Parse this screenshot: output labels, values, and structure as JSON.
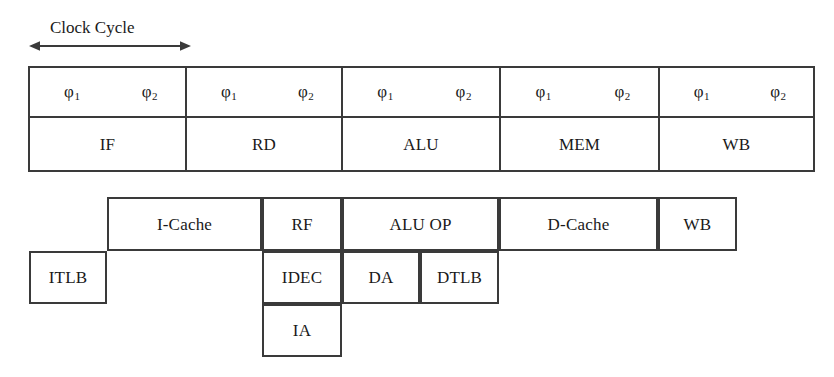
{
  "figure": {
    "line_color": "#3a3a3a",
    "background_color": "#ffffff"
  },
  "clock": {
    "label": "Clock Cycle",
    "arrow_icon": "double-headed-horizontal-arrow",
    "spans_stage": "IF"
  },
  "phase_table": {
    "phase_1_label": "φ",
    "phase_1_sub": "1",
    "phase_2_label": "φ",
    "phase_2_sub": "2",
    "stages": [
      {
        "name": "IF",
        "phase1": "φ",
        "phase1_sub": "1",
        "phase2": "φ",
        "phase2_sub": "2"
      },
      {
        "name": "RD",
        "phase1": "φ",
        "phase1_sub": "1",
        "phase2": "φ",
        "phase2_sub": "2"
      },
      {
        "name": "ALU",
        "phase1": "φ",
        "phase1_sub": "1",
        "phase2": "φ",
        "phase2_sub": "2"
      },
      {
        "name": "MEM",
        "phase1": "φ",
        "phase1_sub": "1",
        "phase2": "φ",
        "phase2_sub": "2"
      },
      {
        "name": "WB",
        "phase1": "φ",
        "phase1_sub": "1",
        "phase2": "φ",
        "phase2_sub": "2"
      }
    ]
  },
  "unit_diagram": {
    "rows": [
      {
        "row": 1,
        "units": [
          {
            "name": "I-Cache",
            "x": 107,
            "w": 155
          },
          {
            "name": "RF",
            "x": 262,
            "w": 80
          },
          {
            "name": "ALU OP",
            "x": 342,
            "w": 157
          },
          {
            "name": "D-Cache",
            "x": 499,
            "w": 159
          },
          {
            "name": "WB",
            "x": 658,
            "w": 79
          }
        ]
      },
      {
        "row": 2,
        "units": [
          {
            "name": "ITLB",
            "x": 29,
            "w": 78
          },
          {
            "name": "IDEC",
            "x": 262,
            "w": 80
          },
          {
            "name": "DA",
            "x": 342,
            "w": 78
          },
          {
            "name": "DTLB",
            "x": 420,
            "w": 79
          }
        ]
      },
      {
        "row": 3,
        "units": [
          {
            "name": "IA",
            "x": 262,
            "w": 80
          }
        ]
      }
    ]
  }
}
